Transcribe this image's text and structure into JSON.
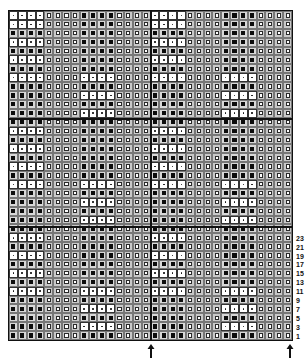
{
  "chart": {
    "type": "knitting-chart",
    "columns": 32,
    "rows": 37,
    "repeat_columns": 16,
    "section_rows": 12,
    "symbols": {
      "black": "filled-square",
      "hatch": "hatched-square",
      "dot": "white-square-with-dot"
    },
    "column_blocks": [
      "A",
      "H",
      "B",
      "H",
      "A",
      "H",
      "B",
      "H"
    ],
    "block_width": 4,
    "block_A_dot_rows_in_section": [
      1,
      3,
      5,
      7
    ],
    "block_B_dot_rows_in_section": [
      7,
      9,
      11
    ],
    "extra_top_row": "A-dots"
  },
  "row_labels": [
    "23",
    "21",
    "19",
    "17",
    "15",
    "13",
    "11",
    "9",
    "7",
    "5",
    "3",
    "1"
  ],
  "repeat_markers": [
    "arrow-up",
    "arrow-up"
  ]
}
